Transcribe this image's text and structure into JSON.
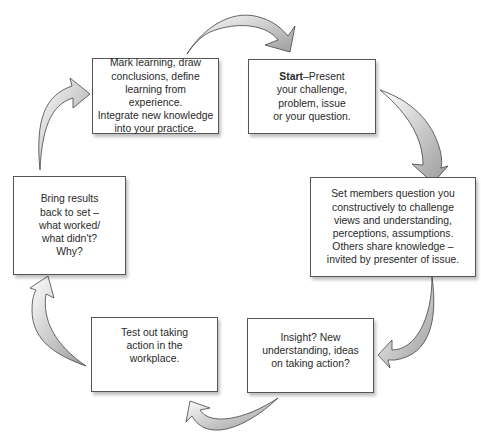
{
  "diagram": {
    "type": "cycle",
    "steps": [
      {
        "id": "start",
        "bold_prefix": "Start",
        "text": "–Present your challenge, problem, issue or your question.",
        "lines": [
          "Present",
          "your challenge,",
          "problem, issue",
          "or your question."
        ]
      },
      {
        "id": "question",
        "text": "Set members question you constructively to challenge views and understanding, perceptions, assumptions. Others share knowledge – invited by presenter of issue.",
        "lines": [
          "Set members question you",
          "constructively to challenge",
          "views and understanding,",
          "perceptions, assumptions.",
          "Others share knowledge –",
          "invited by presenter of issue."
        ]
      },
      {
        "id": "insight",
        "text": "Insight? New understanding, ideas on taking action?",
        "lines": [
          "Insight? New",
          "understanding, ideas",
          "on taking action?"
        ]
      },
      {
        "id": "test",
        "text": "Test out taking action in the workplace.",
        "lines": [
          "Test out taking",
          "action in the",
          "workplace."
        ]
      },
      {
        "id": "results",
        "text": "Bring results back to set – what worked/ what didn't? Why?",
        "lines": [
          "Bring results",
          "back to set –",
          "what worked/",
          "what didn't?",
          "Why?"
        ]
      },
      {
        "id": "learning",
        "text": "Mark learning, draw conclusions, define learning from experience. Integrate new knowledge into your practice.",
        "lines": [
          "Mark learning, draw",
          "conclusions, define",
          "learning from experience.",
          "Integrate new knowledge",
          "into your practice."
        ]
      }
    ],
    "arrow_color": "#b8b8b8",
    "arrow_stroke": "#444444"
  }
}
